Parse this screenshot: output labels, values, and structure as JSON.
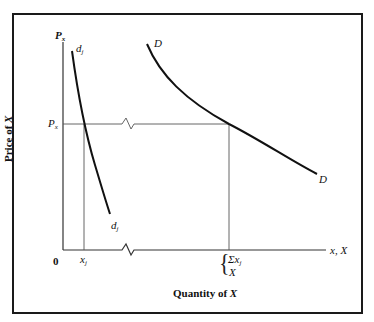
{
  "diagram": {
    "type": "economics-demand-aggregation",
    "y_axis": {
      "top_label": "P",
      "top_label_sub": "x",
      "title_prefix": "Price of ",
      "title_var": "X",
      "price_level_label": "P",
      "price_level_sub": "x"
    },
    "x_axis": {
      "origin_label": "0",
      "end_label": "x, X",
      "title_prefix": "Quantity of ",
      "title_var": "X",
      "individual_quantity_label": "x",
      "individual_quantity_sub": "j",
      "market_quantity_sum_label": "Σx",
      "market_quantity_sum_sub": "j",
      "market_quantity_label": "X"
    },
    "curves": [
      {
        "name": "individual-demand",
        "label": "d",
        "label_sub": "j",
        "color": "#111111"
      },
      {
        "name": "market-demand",
        "label": "D",
        "color": "#111111"
      }
    ],
    "colors": {
      "curve": "#111111",
      "axis": "#333333",
      "guide": "#555555",
      "frame": "#1a1a1a",
      "background": "#ffffff"
    }
  }
}
